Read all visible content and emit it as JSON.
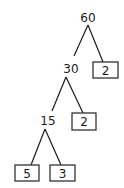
{
  "diagram": {
    "type": "factor-tree",
    "nodes": {
      "root": {
        "value": "60",
        "kind": "composite"
      },
      "n30": {
        "value": "30",
        "kind": "composite"
      },
      "leaf2a": {
        "value": "2",
        "kind": "prime-leaf"
      },
      "n15": {
        "value": "15",
        "kind": "composite"
      },
      "leaf2b": {
        "value": "2",
        "kind": "prime-leaf"
      },
      "leaf5": {
        "value": "5",
        "kind": "prime-leaf"
      },
      "leaf3": {
        "value": "3",
        "kind": "prime-leaf"
      }
    },
    "edges": [
      [
        "root",
        "n30"
      ],
      [
        "root",
        "leaf2a"
      ],
      [
        "n30",
        "n15"
      ],
      [
        "n30",
        "leaf2b"
      ],
      [
        "n15",
        "leaf5"
      ],
      [
        "n15",
        "leaf3"
      ]
    ],
    "colors": {
      "stroke": "#1a1a1a",
      "box_border": "#333333",
      "background": "#ffffff"
    }
  }
}
